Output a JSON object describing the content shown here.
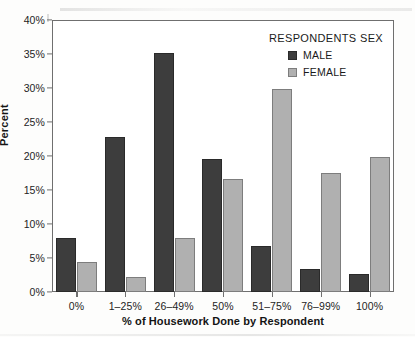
{
  "chart_data": {
    "type": "bar",
    "title": "",
    "xlabel": "% of Housework Done by Respondent",
    "ylabel": "Percent",
    "categories": [
      "0%",
      "1–25%",
      "26–49%",
      "50%",
      "51–75%",
      "76–99%",
      "100%"
    ],
    "series": [
      {
        "name": "MALE",
        "color": "#3d3d3d",
        "values": [
          7.9,
          22.8,
          35.1,
          19.6,
          6.7,
          3.4,
          2.7
        ]
      },
      {
        "name": "FEMALE",
        "color": "#b0b0b0",
        "values": [
          4.4,
          2.2,
          8.0,
          16.6,
          29.9,
          17.5,
          19.8
        ]
      }
    ],
    "ylim": [
      0,
      40
    ],
    "yticks": [
      0,
      5,
      10,
      15,
      20,
      25,
      30,
      35,
      40
    ],
    "ytick_labels": [
      "0%",
      "5%",
      "10%",
      "15%",
      "20%",
      "25%",
      "30%",
      "35%",
      "40%"
    ],
    "grid": false,
    "legend_position": "top-right",
    "legend_title": "RESPONDENTS SEX"
  },
  "axes": {
    "y_title": "Percent",
    "x_title": "% of Housework Done by Respondent"
  },
  "legend": {
    "title": "RESPONDENTS SEX",
    "entries": [
      {
        "label": "MALE"
      },
      {
        "label": "FEMALE"
      }
    ]
  }
}
